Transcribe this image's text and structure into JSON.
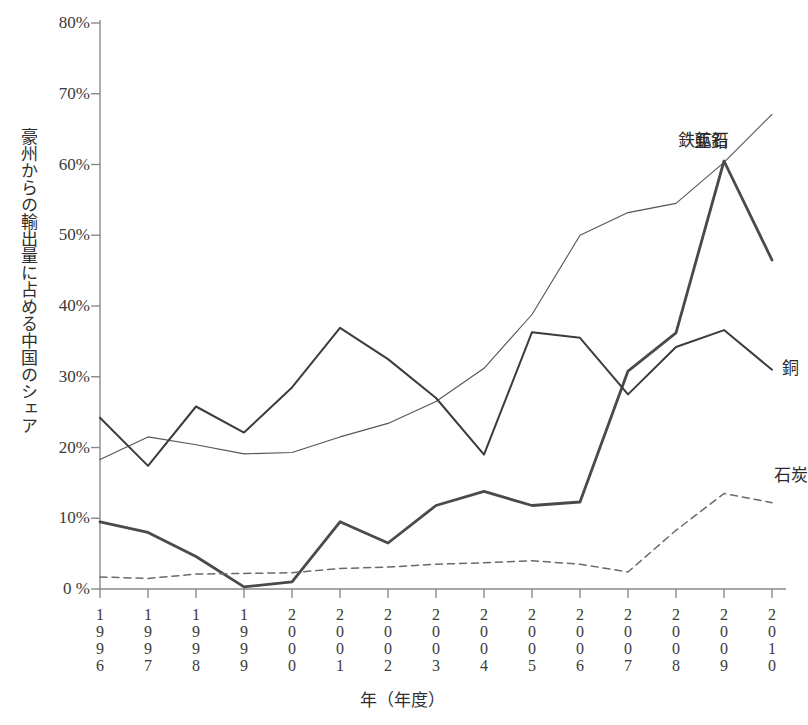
{
  "chart_data": {
    "type": "line",
    "title": "",
    "xlabel": "年（年度）",
    "ylabel": "豪州からの輸出量に占める中国のシェア",
    "categories": [
      "1996",
      "1997",
      "1998",
      "1999",
      "2000",
      "2001",
      "2002",
      "2003",
      "2004",
      "2005",
      "2006",
      "2007",
      "2008",
      "2009",
      "2010"
    ],
    "ylim": [
      0,
      80
    ],
    "yticks": [
      "0 %",
      "10%",
      "20%",
      "30%",
      "40%",
      "50%",
      "60%",
      "70%",
      "80%"
    ],
    "ytick_values": [
      0,
      10,
      20,
      30,
      40,
      50,
      60,
      70,
      80
    ],
    "grid": false,
    "legend_position": "inline-end-of-line",
    "series": [
      {
        "name": "鉄鉱石",
        "style": "thin-solid",
        "color": "#555555",
        "values": [
          18.3,
          21.5,
          20.4,
          19.1,
          19.3,
          21.5,
          23.4,
          26.5,
          31.2,
          38.8,
          50.0,
          53.2,
          54.5,
          60.3,
          67.1
        ]
      },
      {
        "name": "亜鉛",
        "style": "thick-solid",
        "color": "#4a4a4a",
        "values": [
          9.5,
          8.0,
          4.6,
          0.3,
          1.0,
          9.5,
          6.5,
          11.8,
          13.8,
          11.8,
          12.3,
          30.8,
          36.2,
          60.5,
          46.5
        ]
      },
      {
        "name": "銅",
        "style": "medium-solid",
        "color": "#3c3c3c",
        "values": [
          24.2,
          17.4,
          25.8,
          22.1,
          28.5,
          36.9,
          32.5,
          27.0,
          19.0,
          36.3,
          35.5,
          27.5,
          34.2,
          36.6,
          31.0
        ]
      },
      {
        "name": "石炭",
        "style": "dashed",
        "color": "#6a6a6a",
        "values": [
          1.7,
          1.5,
          2.1,
          2.2,
          2.3,
          2.9,
          3.1,
          3.5,
          3.7,
          4.0,
          3.5,
          2.4,
          8.3,
          13.5,
          12.2
        ]
      }
    ]
  }
}
